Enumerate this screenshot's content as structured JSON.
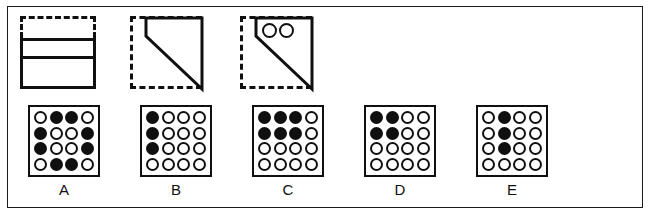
{
  "puzzle": {
    "kind": "visual-analogy-paper-folding",
    "stimulus": {
      "shapes": [
        {
          "id": "shape-1",
          "name": "folded-sheet-two-bands",
          "dashed_outline": "rectangle",
          "solid_figure": "rectangle-with-horizontal-divider",
          "holes": []
        },
        {
          "id": "shape-2",
          "name": "folded-sheet-diagonal",
          "dashed_outline": "square",
          "solid_figure": "diagonal-wedge",
          "holes": []
        },
        {
          "id": "shape-3",
          "name": "punched-sheet-diagonal",
          "dashed_outline": "square",
          "solid_figure": "diagonal-wedge",
          "holes": [
            "hole-left",
            "hole-right"
          ]
        }
      ]
    },
    "options": [
      {
        "label": "A",
        "grid": [
          [
            0,
            1,
            1,
            0
          ],
          [
            1,
            0,
            0,
            1
          ],
          [
            1,
            0,
            0,
            1
          ],
          [
            0,
            1,
            1,
            0
          ]
        ],
        "filled_count": 8
      },
      {
        "label": "B",
        "grid": [
          [
            1,
            0,
            0,
            0
          ],
          [
            1,
            0,
            0,
            0
          ],
          [
            1,
            0,
            0,
            0
          ],
          [
            0,
            0,
            0,
            0
          ]
        ],
        "filled_count": 3
      },
      {
        "label": "C",
        "grid": [
          [
            1,
            1,
            1,
            0
          ],
          [
            1,
            1,
            1,
            0
          ],
          [
            0,
            0,
            0,
            0
          ],
          [
            0,
            0,
            0,
            0
          ]
        ],
        "filled_count": 6
      },
      {
        "label": "D",
        "grid": [
          [
            1,
            1,
            0,
            0
          ],
          [
            1,
            1,
            0,
            0
          ],
          [
            0,
            0,
            0,
            0
          ],
          [
            0,
            0,
            0,
            0
          ]
        ],
        "filled_count": 4
      },
      {
        "label": "E",
        "grid": [
          [
            0,
            1,
            0,
            0
          ],
          [
            0,
            1,
            0,
            0
          ],
          [
            0,
            1,
            0,
            0
          ],
          [
            0,
            0,
            0,
            0
          ]
        ],
        "filled_count": 3
      }
    ],
    "colors": {
      "ink": "#101010",
      "paper": "#ffffff",
      "frame": "#1b1b1b"
    }
  }
}
